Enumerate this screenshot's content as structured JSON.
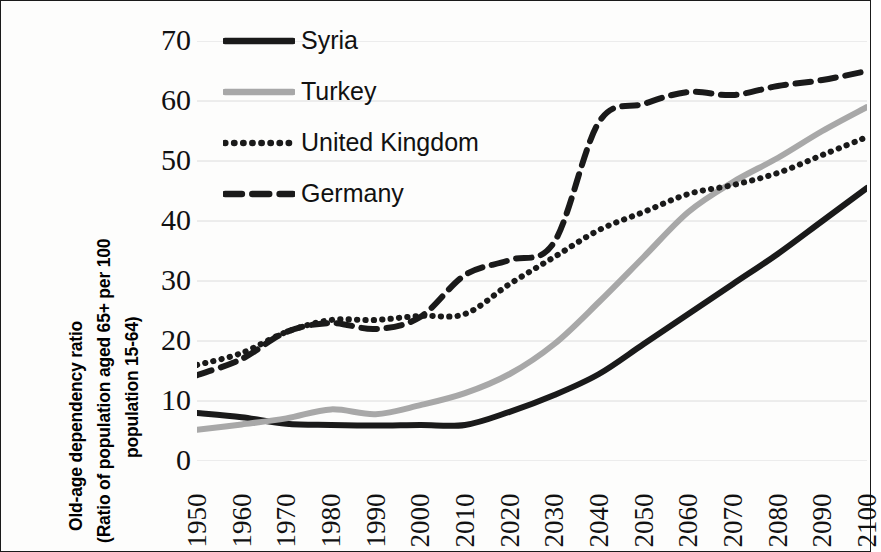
{
  "axis": {
    "y_title_line1": "Old-age dependency ratio",
    "y_title_line2": "(Ratio of population aged 65+ per 100",
    "y_title_line3": "population 15-64)",
    "y_ticks": [
      "70",
      "60",
      "50",
      "40",
      "30",
      "20",
      "10",
      "0"
    ],
    "y_min": 0,
    "y_max": 70,
    "y_step": 10,
    "x_ticks": [
      "1950",
      "1960",
      "1970",
      "1980",
      "1990",
      "2000",
      "2010",
      "2020",
      "2030",
      "2040",
      "2050",
      "2060",
      "2070",
      "2080",
      "2090",
      "2100"
    ]
  },
  "legend": {
    "position": "top-left-inside",
    "items": [
      {
        "label": "Syria",
        "style": "solid",
        "color": "#1a1a1a",
        "key": "legend-key-syria"
      },
      {
        "label": "Turkey",
        "style": "solid",
        "color": "#a8a8a8",
        "key": "legend-key-turkey"
      },
      {
        "label": "United Kingdom",
        "style": "dotted",
        "color": "#1a1a1a",
        "key": "legend-key-united-kingdom"
      },
      {
        "label": "Germany",
        "style": "dashed",
        "color": "#1a1a1a",
        "key": "legend-key-germany"
      }
    ]
  },
  "chart_data": {
    "type": "line",
    "title": "",
    "xlabel": "",
    "ylabel": "Old-age dependency ratio (Ratio of population aged 65+ per 100 population 15-64)",
    "xlim": [
      1950,
      2100
    ],
    "ylim": [
      0,
      70
    ],
    "grid": true,
    "grid_axis": "y",
    "legend_position": "top-left-inside",
    "x": [
      1950,
      1960,
      1970,
      1980,
      1990,
      2000,
      2010,
      2020,
      2030,
      2040,
      2050,
      2060,
      2070,
      2080,
      2090,
      2100
    ],
    "series": [
      {
        "name": "Syria",
        "color": "#1a1a1a",
        "style": "solid",
        "values": [
          8.0,
          7.3,
          6.2,
          6.0,
          5.9,
          6.0,
          6.0,
          8.2,
          11.0,
          14.5,
          19.5,
          24.5,
          29.5,
          34.5,
          40.0,
          45.5
        ]
      },
      {
        "name": "Turkey",
        "color": "#a8a8a8",
        "style": "solid",
        "values": [
          5.2,
          6.1,
          7.1,
          8.6,
          7.8,
          9.3,
          11.3,
          14.5,
          19.5,
          26.5,
          34.0,
          41.5,
          46.5,
          50.5,
          55.0,
          59.0
        ]
      },
      {
        "name": "United Kingdom",
        "color": "#1a1a1a",
        "style": "dotted",
        "values": [
          16.0,
          18.0,
          21.5,
          23.5,
          23.5,
          24.2,
          24.5,
          29.5,
          34.0,
          38.5,
          41.5,
          44.5,
          46.0,
          48.0,
          51.0,
          54.0
        ]
      },
      {
        "name": "Germany",
        "color": "#1a1a1a",
        "style": "dashed",
        "values": [
          14.3,
          17.0,
          21.5,
          23.0,
          22.0,
          24.0,
          31.0,
          33.5,
          36.5,
          56.5,
          59.5,
          61.5,
          61.0,
          62.5,
          63.5,
          65.0
        ]
      }
    ]
  },
  "style": {
    "background": "#ffffff",
    "border_color": "#1a1a1a",
    "grid_color": "#dcdcdc",
    "text_color": "#111111"
  }
}
